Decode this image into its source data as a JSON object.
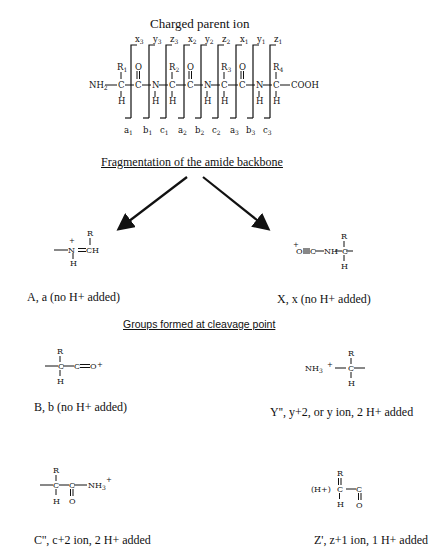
{
  "title": "Charged parent ion",
  "parent_ion": {
    "n_terminus": "NH2",
    "c_terminus": "COOH",
    "side_chains": [
      "R1",
      "R2",
      "R3",
      "R4"
    ],
    "top_labels": [
      "x3",
      "y3",
      "z3",
      "x2",
      "y2",
      "z2",
      "x1",
      "y1",
      "z1"
    ],
    "bottom_labels": [
      "a1",
      "b1",
      "c1",
      "a2",
      "b2",
      "c2",
      "a3",
      "b3",
      "c3"
    ]
  },
  "headings": {
    "fragmentation": "Fragmentation of the amide backbone",
    "groups": "Groups formed at cleavage point"
  },
  "fragments": [
    {
      "id": "A",
      "formula": "—N⁺(H)=CH(R)",
      "caption": "A, a (no H+ added)"
    },
    {
      "id": "X",
      "formula": "⁺O≡C—NH—C(R)(H)—",
      "caption": "X, x (no H+ added)"
    },
    {
      "id": "B",
      "formula": "—C(R)(H)—C≡O⁺",
      "caption": "B, b (no H+ added)"
    },
    {
      "id": "Y",
      "formula": "NH3⁺—C(R)(H)—",
      "caption": "Y'', y+2, or y ion, 2 H+ added"
    },
    {
      "id": "C",
      "formula": "—C(R)(H)—C(=O)—NH3⁺",
      "caption": "C'', c+2 ion, 2 H+ added"
    },
    {
      "id": "Z",
      "formula": "(H+)C(=R)(H)—C(=O)",
      "caption": "Z', z+1 ion, 1 H+ added"
    }
  ]
}
